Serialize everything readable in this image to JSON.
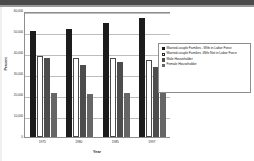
{
  "chart_data": {
    "type": "bar",
    "title": "",
    "xlabel": "Year",
    "ylabel": "Percent",
    "categories": [
      "1975",
      "1980",
      "1985",
      "1997"
    ],
    "ylim": [
      0,
      60000
    ],
    "ytick_labels": [
      "60,000",
      "50,000",
      "40,000",
      "30,000",
      "20,000",
      "10,000",
      "0"
    ],
    "ytick_values": [
      60000,
      50000,
      40000,
      30000,
      20000,
      10000,
      0
    ],
    "grid": true,
    "legend_position": "right",
    "series": [
      {
        "name": "Married-couple Families - Wife in Labor Force",
        "color": "#1c1c1c",
        "values": [
          50500,
          51500,
          54500,
          56500
        ]
      },
      {
        "name": "Married-couple Families -Wife Not in Labor Force",
        "color": "#ffffff",
        "values": [
          38500,
          37500,
          37500,
          36500
        ]
      },
      {
        "name": "Male Householder",
        "color": "#4d4d4d",
        "values": [
          37500,
          34500,
          35500,
          33500
        ]
      },
      {
        "name": "Female Householder",
        "color": "#666666",
        "values": [
          21000,
          20500,
          21000,
          21000
        ]
      }
    ]
  }
}
